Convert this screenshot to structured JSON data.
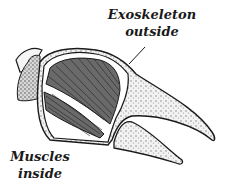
{
  "diagram": {
    "labels": {
      "exoskeleton": {
        "line1": "Exoskeleton",
        "line2": "outside"
      },
      "muscles": {
        "line1": "Muscles",
        "line2": "inside"
      }
    },
    "colors": {
      "ink": "#1a1a1a",
      "shell_fill": "#e9e9e9",
      "muscle_fill": "#5a5a5a",
      "background": "#ffffff"
    }
  }
}
